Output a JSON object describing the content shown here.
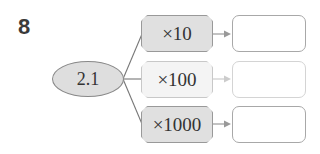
{
  "question": {
    "number": "8"
  },
  "start": {
    "value": "2.1"
  },
  "operations": [
    {
      "label": "×10",
      "result": ""
    },
    {
      "label": "×100",
      "result": ""
    },
    {
      "label": "×1000",
      "result": ""
    }
  ]
}
